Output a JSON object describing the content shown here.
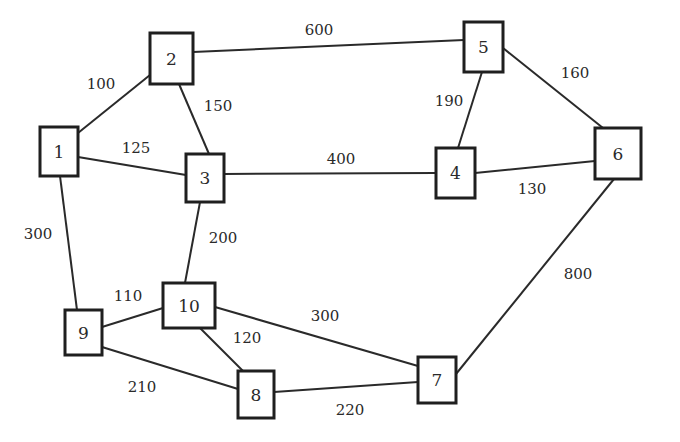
{
  "diagram": {
    "type": "weighted-undirected-graph",
    "nodes": [
      {
        "id": "1",
        "label": "1",
        "x": 40,
        "y": 127,
        "w": 38,
        "h": 49
      },
      {
        "id": "2",
        "label": "2",
        "x": 150,
        "y": 33,
        "w": 43,
        "h": 51
      },
      {
        "id": "3",
        "label": "3",
        "x": 186,
        "y": 154,
        "w": 38,
        "h": 48
      },
      {
        "id": "4",
        "label": "4",
        "x": 436,
        "y": 148,
        "w": 39,
        "h": 50
      },
      {
        "id": "5",
        "label": "5",
        "x": 464,
        "y": 22,
        "w": 39,
        "h": 50
      },
      {
        "id": "6",
        "label": "6",
        "x": 595,
        "y": 128,
        "w": 46,
        "h": 51
      },
      {
        "id": "7",
        "label": "7",
        "x": 418,
        "y": 357,
        "w": 38,
        "h": 46
      },
      {
        "id": "8",
        "label": "8",
        "x": 238,
        "y": 371,
        "w": 36,
        "h": 47
      },
      {
        "id": "9",
        "label": "9",
        "x": 65,
        "y": 310,
        "w": 37,
        "h": 45
      },
      {
        "id": "10",
        "label": "10",
        "x": 163,
        "y": 283,
        "w": 52,
        "h": 45
      }
    ],
    "edges": [
      {
        "from": "1",
        "to": "2",
        "weight": "100",
        "x1": 78,
        "y1": 133,
        "x2": 150,
        "y2": 75,
        "lx": 101,
        "ly": 84
      },
      {
        "from": "1",
        "to": "3",
        "weight": "125",
        "x1": 78,
        "y1": 157,
        "x2": 186,
        "y2": 175,
        "lx": 136,
        "ly": 148
      },
      {
        "from": "1",
        "to": "9",
        "weight": "300",
        "x1": 60,
        "y1": 176,
        "x2": 77,
        "y2": 310,
        "lx": 38,
        "ly": 234
      },
      {
        "from": "2",
        "to": "3",
        "weight": "150",
        "x1": 179,
        "y1": 84,
        "x2": 209,
        "y2": 154,
        "lx": 218,
        "ly": 106
      },
      {
        "from": "2",
        "to": "5",
        "weight": "600",
        "x1": 193,
        "y1": 52,
        "x2": 464,
        "y2": 40,
        "lx": 319,
        "ly": 30
      },
      {
        "from": "3",
        "to": "4",
        "weight": "400",
        "x1": 224,
        "y1": 174,
        "x2": 436,
        "y2": 173,
        "lx": 341,
        "ly": 159
      },
      {
        "from": "3",
        "to": "10",
        "weight": "200",
        "x1": 200,
        "y1": 202,
        "x2": 185,
        "y2": 283,
        "lx": 223,
        "ly": 238
      },
      {
        "from": "5",
        "to": "4",
        "weight": "190",
        "x1": 482,
        "y1": 72,
        "x2": 458,
        "y2": 148,
        "lx": 449,
        "ly": 101
      },
      {
        "from": "5",
        "to": "6",
        "weight": "160",
        "x1": 503,
        "y1": 48,
        "x2": 603,
        "y2": 128,
        "lx": 575,
        "ly": 73
      },
      {
        "from": "4",
        "to": "6",
        "weight": "130",
        "x1": 475,
        "y1": 173,
        "x2": 595,
        "y2": 161,
        "lx": 532,
        "ly": 189
      },
      {
        "from": "6",
        "to": "7",
        "weight": "800",
        "x1": 614,
        "y1": 179,
        "x2": 456,
        "y2": 374,
        "lx": 578,
        "ly": 274
      },
      {
        "from": "9",
        "to": "10",
        "weight": "110",
        "x1": 102,
        "y1": 327,
        "x2": 163,
        "y2": 308,
        "lx": 128,
        "ly": 296
      },
      {
        "from": "9",
        "to": "8",
        "weight": "210",
        "x1": 102,
        "y1": 347,
        "x2": 238,
        "y2": 389,
        "lx": 142,
        "ly": 387
      },
      {
        "from": "10",
        "to": "8",
        "weight": "120",
        "x1": 200,
        "y1": 328,
        "x2": 243,
        "y2": 371,
        "lx": 247,
        "ly": 338
      },
      {
        "from": "10",
        "to": "7",
        "weight": "300",
        "x1": 215,
        "y1": 307,
        "x2": 418,
        "y2": 366,
        "lx": 325,
        "ly": 316
      },
      {
        "from": "8",
        "to": "7",
        "weight": "220",
        "x1": 274,
        "y1": 392,
        "x2": 418,
        "y2": 382,
        "lx": 350,
        "ly": 410
      }
    ]
  }
}
